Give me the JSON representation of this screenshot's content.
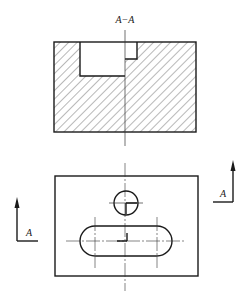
{
  "drawing": {
    "section_title": "A−A",
    "section_label_left": "A",
    "section_label_right": "A"
  },
  "colors": {
    "line": "#1a1a1a",
    "background": "#ffffff"
  }
}
